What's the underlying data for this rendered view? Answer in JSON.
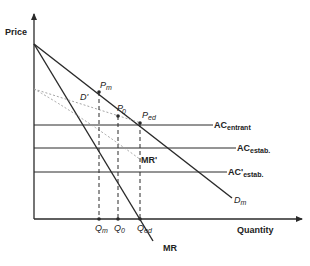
{
  "diagram": {
    "title": "",
    "axes": {
      "y_label": "Price",
      "x_label": "Quantity"
    },
    "curves": {
      "demand": {
        "label": "D",
        "sub": "m"
      },
      "marginal_revenue": {
        "label": "MR"
      },
      "residual_demand": {
        "label": "D'"
      },
      "residual_mr": {
        "label": "MR'"
      }
    },
    "cost_lines": {
      "ac_entrant": {
        "label": "AC",
        "sub": "entrant"
      },
      "ac_estab": {
        "label": "AC",
        "sub": "estab."
      },
      "ac_estab_prime": {
        "label": "AC'",
        "sub": "estab."
      }
    },
    "points": {
      "pm": {
        "label": "P",
        "sub": "m"
      },
      "p0": {
        "label": "P",
        "sub": "0"
      },
      "ped": {
        "label": "P",
        "sub": "ed"
      }
    },
    "quantities": {
      "qm": {
        "label": "Q",
        "sub": "m"
      },
      "q0": {
        "label": "Q",
        "sub": "0"
      },
      "qed": {
        "label": "Q",
        "sub": "ed"
      }
    },
    "colors": {
      "line": "#2a2a2a",
      "dashed": "#9a9a9a",
      "background": "#ffffff"
    }
  }
}
